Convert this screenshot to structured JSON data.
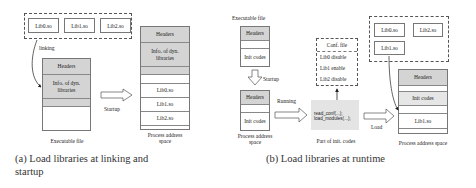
{
  "panel_a": {
    "libs": [
      "Lib0.so",
      "Lib1.so",
      "Lib2.so"
    ],
    "linking_label": "linking",
    "exe": {
      "headers": "Headers",
      "info": "Info. of dyn. libraries",
      "caption": "Executable file"
    },
    "startup_label": "Startup",
    "process": {
      "headers": "Headers",
      "info": "Info. of dyn. libraries",
      "libs": [
        "Lib0.so",
        "Lib1.so",
        "Lib2.so"
      ],
      "caption_line1": "Process address",
      "caption_line2": "space"
    },
    "caption_line1": "(a) Load libraries at linking and",
    "caption_line2": "startup"
  },
  "panel_b": {
    "exe_title": "Executable file",
    "exe": {
      "headers": "Headers",
      "init": "Init codes"
    },
    "startup_label": "Startup",
    "proc_small": {
      "headers": "Headers",
      "init": "Init codes",
      "caption_line1": "Process address",
      "caption_line2": "space"
    },
    "running_label": "Running",
    "conf": {
      "title": "Conf. file",
      "rows": [
        "Lib0 disable",
        "Lib1 enable",
        "Lib2 disable"
      ]
    },
    "code": {
      "line1": "read_conf(...);",
      "line2": "load_modules(...);",
      "caption": "Part of init. codes"
    },
    "load_label": "Load",
    "libs": [
      "Lib0.so",
      "Lib2.so",
      "Lib1.so"
    ],
    "process": {
      "headers": "Headers",
      "init": "Init codes",
      "lib": "Lib1.so",
      "caption": "Process address space"
    },
    "caption": "(b) Load libraries at runtime"
  }
}
